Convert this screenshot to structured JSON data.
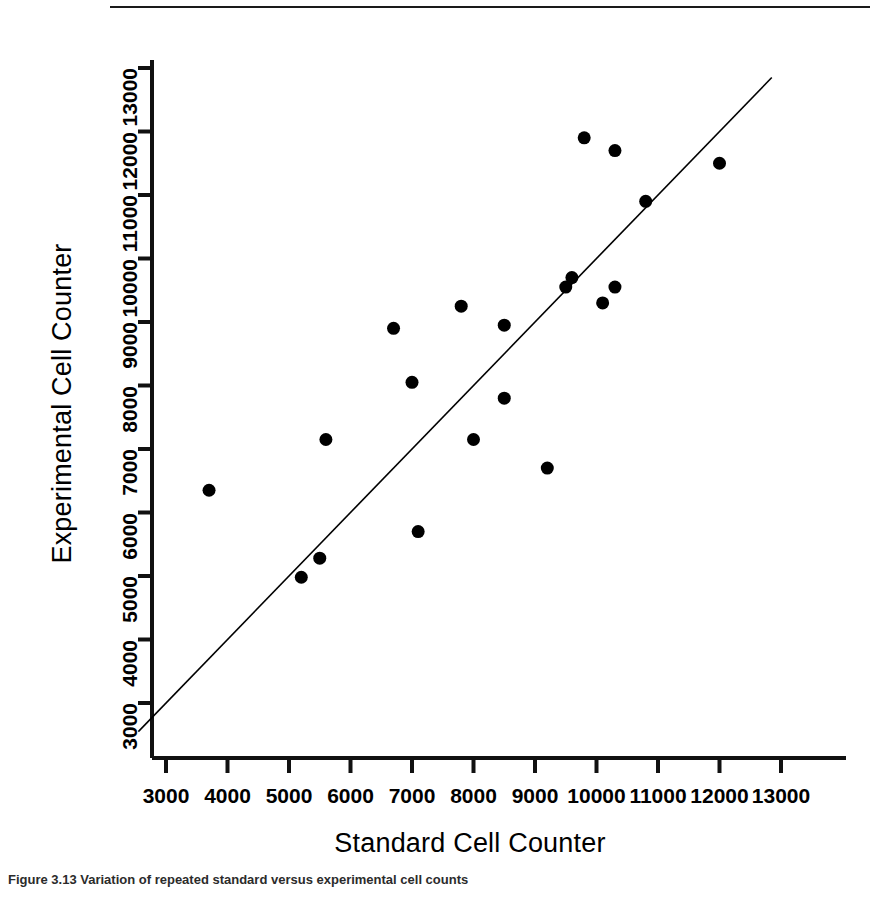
{
  "figure": {
    "caption": "Figure 3.13 Variation of repeated standard versus experimental cell counts"
  },
  "chart_data": {
    "type": "scatter",
    "title": "",
    "xlabel": "Standard Cell Counter",
    "ylabel": "Experimental Cell Counter",
    "xlim": [
      2400,
      13600
    ],
    "ylim": [
      2400,
      13600
    ],
    "grid": false,
    "legend": null,
    "xticks": [
      3000,
      4000,
      5000,
      6000,
      7000,
      8000,
      9000,
      10000,
      11000,
      12000,
      13000
    ],
    "yticks": [
      3000,
      4000,
      5000,
      6000,
      7000,
      8000,
      9000,
      10000,
      11000,
      12000,
      13000
    ],
    "xtick_labels": [
      "3000",
      "4000",
      "5000",
      "6000",
      "7000",
      "8000",
      "9000",
      "10000",
      "11000",
      "12000",
      "13000"
    ],
    "ytick_labels": [
      "3000",
      "4000",
      "5000",
      "6000",
      "7000",
      "8000",
      "9000",
      "10000",
      "11000",
      "12000",
      "13000"
    ],
    "marker": {
      "shape": "circle",
      "color": "#000000",
      "size": 13
    },
    "reference_line": {
      "label": "y = x identity line",
      "color": "#000000",
      "width": 1.6,
      "x": [
        2550,
        12850
      ],
      "y": [
        2550,
        12850
      ]
    },
    "points": [
      {
        "x": 3700,
        "y": 6350
      },
      {
        "x": 5200,
        "y": 4980
      },
      {
        "x": 5500,
        "y": 5280
      },
      {
        "x": 5600,
        "y": 7150
      },
      {
        "x": 6700,
        "y": 8900
      },
      {
        "x": 7000,
        "y": 8050
      },
      {
        "x": 7100,
        "y": 5700
      },
      {
        "x": 7800,
        "y": 9250
      },
      {
        "x": 8000,
        "y": 7150
      },
      {
        "x": 8500,
        "y": 8950
      },
      {
        "x": 8500,
        "y": 7800
      },
      {
        "x": 9200,
        "y": 6700
      },
      {
        "x": 9500,
        "y": 9550
      },
      {
        "x": 9600,
        "y": 9700
      },
      {
        "x": 9800,
        "y": 11900
      },
      {
        "x": 10100,
        "y": 9300
      },
      {
        "x": 10300,
        "y": 11700
      },
      {
        "x": 10300,
        "y": 9550
      },
      {
        "x": 10800,
        "y": 10900
      },
      {
        "x": 12000,
        "y": 11500
      }
    ]
  },
  "colors": {
    "axis": "#111111",
    "marker": "#000000",
    "background": "#ffffff"
  }
}
